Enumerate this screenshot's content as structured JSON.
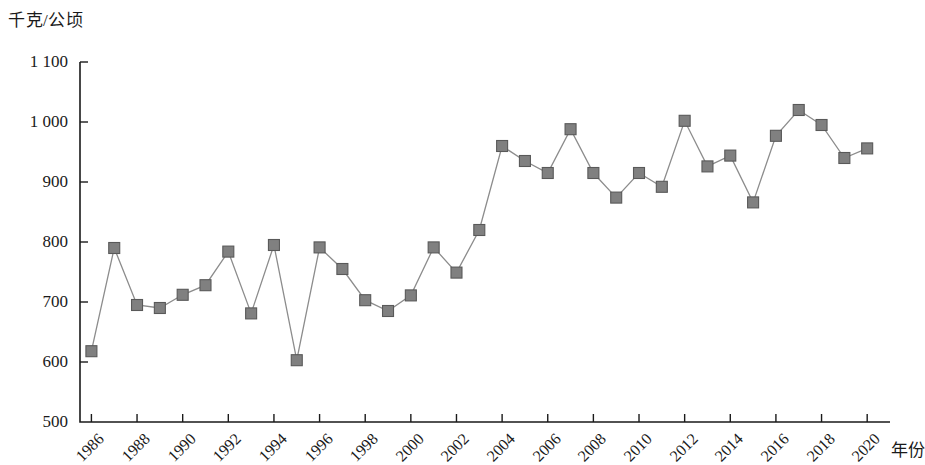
{
  "chart_data": {
    "type": "line",
    "title": "",
    "subtitle": "",
    "ylabel": "千克/公顷",
    "xlabel": "年份",
    "ylim": [
      500,
      1100
    ],
    "ytick_labels": [
      "1 100",
      "1 000",
      "900",
      "800",
      "700",
      "600",
      "500"
    ],
    "ytick_values": [
      1100,
      1000,
      900,
      800,
      700,
      600,
      500
    ],
    "xtick_labels": [
      "1986",
      "1988",
      "1990",
      "1992",
      "1994",
      "1996",
      "1998",
      "2000",
      "2002",
      "2004",
      "2006",
      "2008",
      "2010",
      "2012",
      "2014",
      "2016",
      "2018",
      "2020"
    ],
    "xtick_values": [
      1986,
      1988,
      1990,
      1992,
      1994,
      1996,
      1998,
      2000,
      2002,
      2004,
      2006,
      2008,
      2010,
      2012,
      2014,
      2016,
      2018,
      2020
    ],
    "xlim": [
      1985.5,
      2021
    ],
    "grid": false,
    "legend": null,
    "marker": "square",
    "marker_color": "#808080",
    "marker_edge_color": "#595959",
    "line_color": "#8c8c8c",
    "axis_color": "#1a1a1a",
    "x": [
      1986,
      1987,
      1988,
      1989,
      1990,
      1991,
      1992,
      1993,
      1994,
      1995,
      1996,
      1997,
      1998,
      1999,
      2000,
      2001,
      2002,
      2003,
      2004,
      2005,
      2006,
      2007,
      2008,
      2009,
      2010,
      2011,
      2012,
      2013,
      2014,
      2015,
      2016,
      2017,
      2018,
      2019,
      2020
    ],
    "values": [
      618,
      790,
      695,
      690,
      712,
      728,
      784,
      681,
      795,
      603,
      791,
      755,
      703,
      685,
      711,
      791,
      749,
      820,
      960,
      935,
      915,
      988,
      915,
      874,
      915,
      892,
      1002,
      926,
      944,
      866,
      977,
      1020,
      995,
      940,
      956
    ],
    "series": [
      {
        "name": "单产",
        "values": [
          618,
          790,
          695,
          690,
          712,
          728,
          784,
          681,
          795,
          603,
          791,
          755,
          703,
          685,
          711,
          791,
          749,
          820,
          960,
          935,
          915,
          988,
          915,
          874,
          915,
          892,
          1002,
          926,
          944,
          866,
          977,
          1020,
          995,
          940,
          956
        ]
      }
    ]
  }
}
